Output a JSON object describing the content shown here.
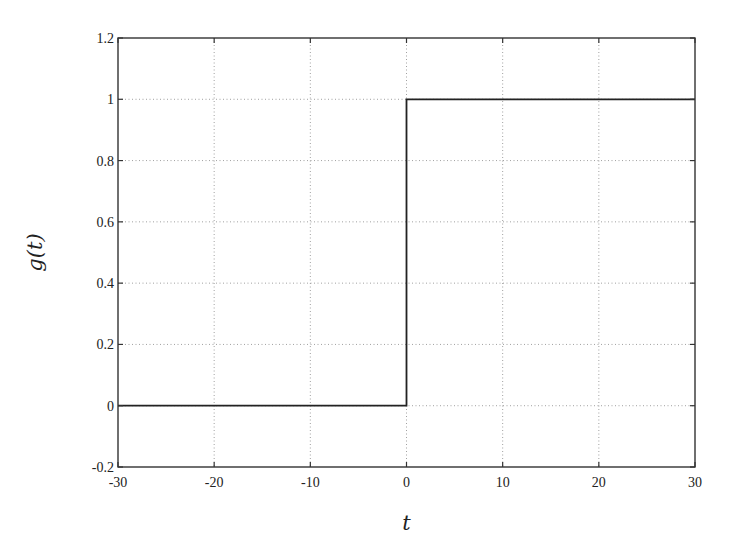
{
  "chart_data": {
    "type": "line",
    "title": "",
    "xlabel": "t",
    "ylabel": "g(t)",
    "xlim": [
      -30,
      30
    ],
    "ylim": [
      -0.2,
      1.2
    ],
    "xticks": [
      -30,
      -20,
      -10,
      0,
      10,
      20,
      30
    ],
    "yticks": [
      -0.2,
      0,
      0.2,
      0.4,
      0.6,
      0.8,
      1,
      1.2
    ],
    "xtick_labels": [
      "-30",
      "-20",
      "-10",
      "0",
      "10",
      "20",
      "30"
    ],
    "ytick_labels": [
      "-0.2",
      "0",
      "0.2",
      "0.4",
      "0.6",
      "0.8",
      "1",
      "1.2"
    ],
    "grid": true,
    "legend": null,
    "series": [
      {
        "name": "g(t) unit step",
        "color": "#222222",
        "x": [
          -30,
          0,
          0,
          30
        ],
        "y": [
          0,
          0,
          1,
          1
        ]
      }
    ]
  }
}
